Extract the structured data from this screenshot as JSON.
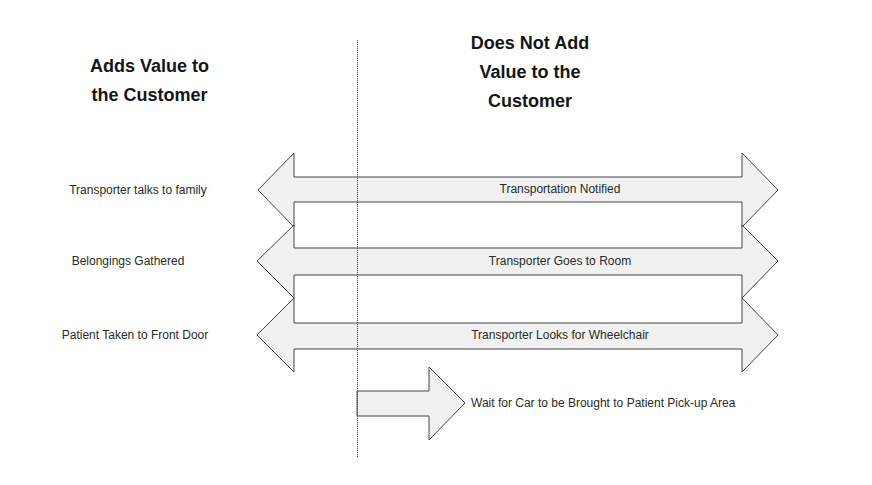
{
  "headings": {
    "left": "Adds Value to\nthe Customer",
    "right": "Does Not Add\nValue to the\nCustomer"
  },
  "rows": [
    {
      "left_label": "Transporter talks to family",
      "bar_label": "Transportation Notified",
      "arrow_type": "double-headed"
    },
    {
      "left_label": "Belongings Gathered",
      "bar_label": "Transporter Goes to Room",
      "arrow_type": "double-headed"
    },
    {
      "left_label": "Patient Taken to Front Door",
      "bar_label": "Transporter Looks for Wheelchair",
      "arrow_type": "double-headed"
    }
  ],
  "final_step": {
    "label": "Wait for Car to be Brought to Patient Pick-up Area",
    "arrow_type": "right-arrow"
  },
  "colors": {
    "arrow_fill": "#f1f1f1",
    "arrow_stroke": "#444444",
    "text": "#2a2a2a",
    "heading": "#151515"
  }
}
